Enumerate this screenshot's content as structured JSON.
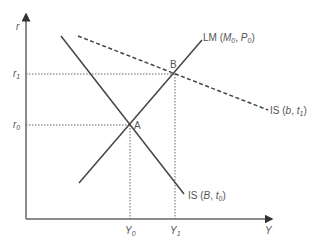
{
  "diagram": {
    "type": "IS-LM",
    "axes": {
      "y_label": "r",
      "x_label": "Y"
    },
    "y_ticks": [
      {
        "base": "r",
        "sub": "1"
      },
      {
        "base": "r",
        "sub": "0"
      }
    ],
    "x_ticks": [
      {
        "base": "Y",
        "sub": "0"
      },
      {
        "base": "Y",
        "sub": "1"
      }
    ],
    "points": [
      {
        "label": "A"
      },
      {
        "label": "B"
      }
    ],
    "curves": {
      "lm": {
        "prefix": "LM (",
        "m": "M",
        "m_sub": "0",
        "sep": ", ",
        "p": "P",
        "p_sub": "0",
        "suffix": ")"
      },
      "is_original": {
        "prefix": "IS (",
        "a": "B",
        "sep": ", ",
        "b": "t",
        "b_sub": "0",
        "suffix": ")"
      },
      "is_shifted": {
        "prefix": "IS (",
        "a": "b",
        "sep": ", ",
        "b": "t",
        "b_sub": "1",
        "suffix": ")",
        "style": "dashed"
      }
    },
    "colors": {
      "line": "#444444",
      "guide": "#666666",
      "text": "#555555"
    }
  }
}
